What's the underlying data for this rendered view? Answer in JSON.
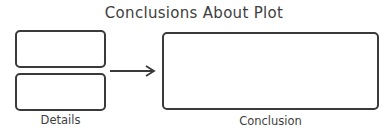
{
  "title": "Conclusions About Plot",
  "details": {
    "label": "Details",
    "boxes": [
      "",
      ""
    ]
  },
  "conclusion": {
    "label": "Conclusion",
    "box": ""
  },
  "colors": {
    "stroke": "#3a3a3a",
    "text": "#3e3e3e",
    "background": "#ffffff"
  }
}
